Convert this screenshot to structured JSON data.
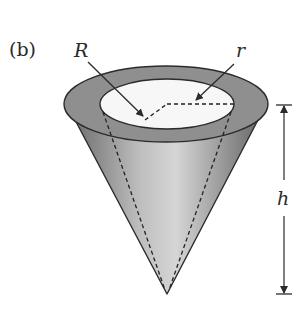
{
  "figure": {
    "panel_label": "(b)",
    "labels": {
      "outer_radius": "R",
      "inner_radius": "r",
      "height": "h"
    },
    "colors": {
      "rim": "#8f8f8f",
      "cone_light": "#d2d2d2",
      "cone_dark": "#7d7d7d",
      "inner_opening": "#f7f7f7",
      "stroke": "#2b2b2b"
    }
  }
}
